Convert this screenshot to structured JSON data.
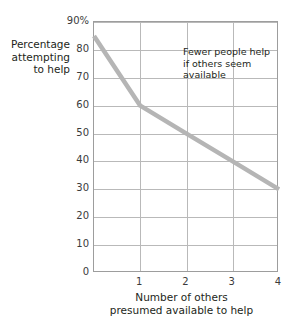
{
  "chart_data": {
    "type": "line",
    "title": "",
    "subtitle": "",
    "xlabel": "Number of others presumed available to help",
    "ylabel": "Percentage attempting to help",
    "xlim": [
      0,
      4
    ],
    "ylim": [
      0,
      90
    ],
    "grid": true,
    "legend": "none",
    "x": [
      0,
      1,
      2,
      3,
      4
    ],
    "series": [
      {
        "name": "Percentage attempting to help",
        "color": "#b5b5b5",
        "values": [
          85,
          60,
          50,
          40,
          30
        ]
      }
    ],
    "x_tick_labels": [
      "1",
      "2",
      "3",
      "4"
    ],
    "x_tick_values": [
      1,
      2,
      3,
      4
    ],
    "y_tick_labels": [
      "90%",
      "80",
      "70",
      "60",
      "50",
      "40",
      "30",
      "20",
      "10",
      "0"
    ],
    "y_tick_values": [
      90,
      80,
      70,
      60,
      50,
      40,
      30,
      20,
      10,
      0
    ],
    "annotations": [
      {
        "name": "fewer-people-help-note",
        "lines": [
          "Fewer people help",
          "if others seem",
          "available"
        ]
      }
    ]
  },
  "axes": {
    "y_title_lines": [
      "Percentage",
      "attempting",
      "to help"
    ],
    "x_title_lines": [
      "Number of others",
      "presumed available to help"
    ]
  },
  "colors": {
    "line": "#b5b5b5",
    "grid": "#b9b9b9",
    "frame": "#9d9d9d",
    "text": "#231f20",
    "tick_text": "#3b3b3b",
    "background": "#ffffff"
  }
}
